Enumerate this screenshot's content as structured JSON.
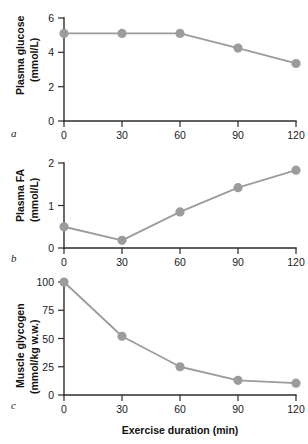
{
  "figure": {
    "panels": [
      {
        "letter": "a",
        "ylabel_line1": "Plasma glucose",
        "ylabel_line2": "(mmol/L)",
        "yticks": [
          "0",
          "2",
          "4",
          "6"
        ],
        "xticks": [
          "0",
          "30",
          "60",
          "90",
          "120"
        ],
        "xlabel": ""
      },
      {
        "letter": "b",
        "ylabel_line1": "Plasma FA",
        "ylabel_line2": "(mmol/L)",
        "yticks": [
          "0",
          "1",
          "2"
        ],
        "xticks": [
          "0",
          "30",
          "60",
          "90",
          "120"
        ],
        "xlabel": ""
      },
      {
        "letter": "c",
        "ylabel_line1": "Muscle glycogen",
        "ylabel_line2": "(mmol/kg w.w.)",
        "yticks": [
          "0",
          "25",
          "50",
          "75",
          "100"
        ],
        "xticks": [
          "0",
          "30",
          "60",
          "90",
          "120"
        ],
        "xlabel": "Exercise duration (min)"
      }
    ],
    "colors": {
      "series": "#9c9c9c",
      "axis": "#2b2b2b",
      "text": "#1a1a1a",
      "background": "#ffffff"
    }
  },
  "chart_data": [
    {
      "type": "line",
      "panel": "a",
      "title": "",
      "xlabel": "",
      "ylabel": "Plasma glucose (mmol/L)",
      "x": [
        0,
        30,
        60,
        90,
        120
      ],
      "values": [
        5.1,
        5.1,
        5.1,
        4.25,
        3.35
      ],
      "xlim": [
        0,
        120
      ],
      "ylim": [
        0,
        6
      ],
      "xticks": [
        0,
        30,
        60,
        90,
        120
      ],
      "yticks": [
        0,
        2,
        4,
        6
      ],
      "grid": false,
      "legend": "none",
      "marker": "circle"
    },
    {
      "type": "line",
      "panel": "b",
      "title": "",
      "xlabel": "",
      "ylabel": "Plasma FA (mmol/L)",
      "x": [
        0,
        30,
        60,
        90,
        120
      ],
      "values": [
        0.5,
        0.18,
        0.85,
        1.42,
        1.83
      ],
      "xlim": [
        0,
        120
      ],
      "ylim": [
        0,
        2
      ],
      "xticks": [
        0,
        30,
        60,
        90,
        120
      ],
      "yticks": [
        0,
        1,
        2
      ],
      "grid": false,
      "legend": "none",
      "marker": "circle"
    },
    {
      "type": "line",
      "panel": "c",
      "title": "",
      "xlabel": "Exercise duration (min)",
      "ylabel": "Muscle glycogen (mmol/kg w.w.)",
      "x": [
        0,
        30,
        60,
        90,
        120
      ],
      "values": [
        100,
        52,
        25,
        13,
        10.5
      ],
      "xlim": [
        0,
        120
      ],
      "ylim": [
        0,
        100
      ],
      "xticks": [
        0,
        30,
        60,
        90,
        120
      ],
      "yticks": [
        0,
        25,
        50,
        75,
        100
      ],
      "grid": false,
      "legend": "none",
      "marker": "circle"
    }
  ]
}
